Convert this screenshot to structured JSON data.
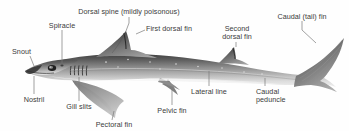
{
  "figure": {
    "background_color": "#fefefe",
    "label_color": "#3a3a3a",
    "leader_color": "#7a7a7a",
    "body_dark": "#4c4c4c",
    "body_mid": "#8d8d8d",
    "body_light": "#d8d8d8"
  },
  "labels": {
    "dorsal_spine": "Dorsal spine (mildly poisonous)",
    "first_dorsal_fin": "First dorsal fin",
    "second_dorsal_fin_line1": "Second",
    "second_dorsal_fin_line2": "dorsal fin",
    "caudal_tail_fin": "Caudal (tail) fin",
    "spiracle": "Spiracle",
    "snout": "Snout",
    "nostril": "Nostril",
    "gill_slits": "Gill slits",
    "pectoral_fin": "Pectoral fin",
    "pelvic_fin": "Pelvic fin",
    "lateral_line": "Lateral line",
    "caudal_peduncle_line1": "Caudal",
    "caudal_peduncle_line2": "peduncle"
  }
}
